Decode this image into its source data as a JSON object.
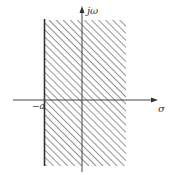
{
  "diagram": {
    "axes": {
      "vertical_label": "jω",
      "horizontal_label": "σ"
    },
    "boundary": {
      "label": "−a"
    },
    "region": {
      "description": "hatched region to the right of σ = −a",
      "hatch_color": "#555555"
    },
    "colors": {
      "line": "#333333",
      "hatch": "#666666",
      "background": "#ffffff"
    }
  }
}
